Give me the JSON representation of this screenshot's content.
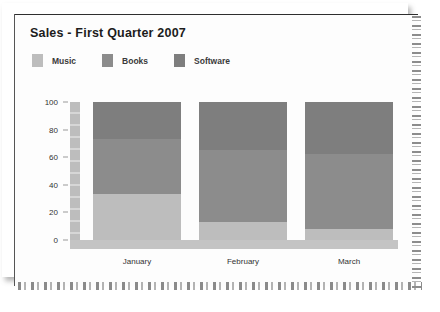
{
  "chart_data": {
    "type": "bar",
    "stacked": true,
    "title": "Sales - First Quarter 2007",
    "xlabel": "",
    "ylabel": "",
    "categories": [
      "January",
      "February",
      "March"
    ],
    "series": [
      {
        "name": "Music",
        "color": "#bdbdbd",
        "values": [
          33,
          13,
          8
        ]
      },
      {
        "name": "Books",
        "color": "#8c8c8c",
        "values": [
          40,
          52,
          54
        ]
      },
      {
        "name": "Software",
        "color": "#7e7e7e",
        "values": [
          27,
          35,
          38
        ]
      }
    ],
    "ylim": [
      0,
      100
    ],
    "yticks": [
      100,
      80,
      60,
      40,
      20,
      0
    ],
    "grid": false,
    "legend_position": "top-left"
  },
  "legend": {
    "items": [
      {
        "label": "Music",
        "color": "#bdbdbd"
      },
      {
        "label": "Books",
        "color": "#8c8c8c"
      },
      {
        "label": "Software",
        "color": "#7e7e7e"
      }
    ]
  }
}
